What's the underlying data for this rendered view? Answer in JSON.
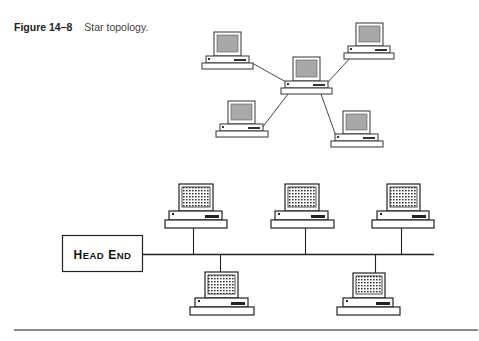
{
  "figure": {
    "number_label": "Figure 14–8",
    "title": "Star topology."
  },
  "colors": {
    "line": "#222222",
    "screen_gray": "#a8a8a8",
    "rule": "#8a8a8a",
    "background": "#ffffff"
  },
  "star_topology": {
    "hub": "center-computer",
    "nodes": [
      "top-left-computer",
      "top-right-computer",
      "bottom-left-computer",
      "bottom-right-computer"
    ],
    "node_count": 5
  },
  "bus_topology": {
    "head_end": {
      "label_first_big": "H",
      "label_first_rest": "EAD",
      "label_second_big": "E",
      "label_second_rest": "ND",
      "label": "HEAD END"
    },
    "nodes_above_bus": 3,
    "nodes_below_bus": 2
  }
}
